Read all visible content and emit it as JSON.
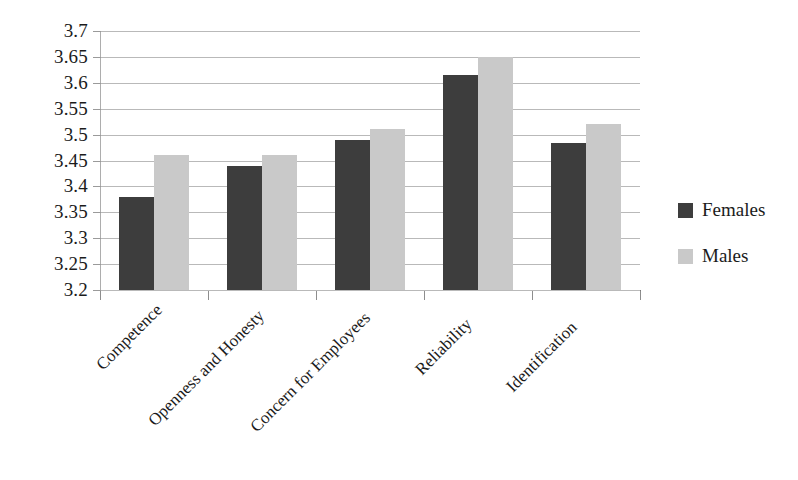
{
  "chart_data": {
    "type": "bar",
    "title": "",
    "subtitle": "",
    "xlabel": "",
    "ylabel": "",
    "categories": [
      "Competence",
      "Openness and Honesty",
      "Concern for Employees",
      "Reliability",
      "Identification"
    ],
    "series": [
      {
        "name": "Females",
        "color": "#3d3d3d",
        "values": [
          3.38,
          3.44,
          3.49,
          3.615,
          3.483
        ]
      },
      {
        "name": "Males",
        "color": "#c9c9c9",
        "values": [
          3.46,
          3.46,
          3.51,
          3.65,
          3.52
        ]
      }
    ],
    "ylim": [
      3.2,
      3.7
    ],
    "ytick_labels": [
      "3.7",
      "3.65",
      "3.6",
      "3.55",
      "3.5",
      "3.45",
      "3.4",
      "3.35",
      "3.3",
      "3.25",
      "3.2"
    ],
    "ytick_values": [
      3.7,
      3.65,
      3.6,
      3.55,
      3.5,
      3.45,
      3.4,
      3.35,
      3.3,
      3.25,
      3.2
    ],
    "ytick_step": 0.05,
    "grid": true,
    "grid_axis": "y",
    "legend": [
      "Females",
      "Males"
    ],
    "legend_position": "right",
    "xtick_label_rotation": -45,
    "background_color": "#ffffff",
    "gridline_color": "#b9b9b9"
  }
}
